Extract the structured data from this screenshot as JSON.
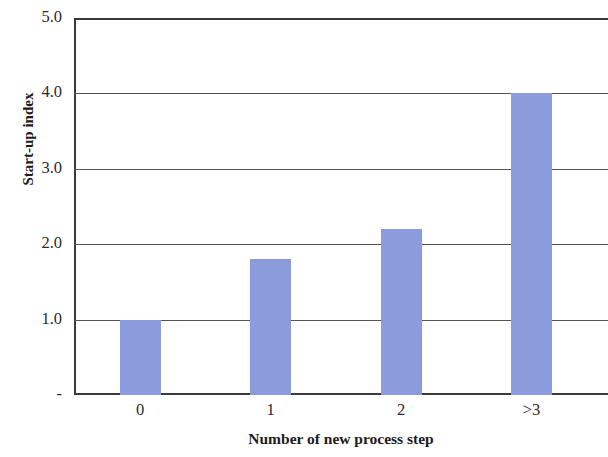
{
  "chart_data": {
    "type": "bar",
    "title": "",
    "categories": [
      "0",
      "1",
      "2",
      ">3"
    ],
    "values": [
      1.0,
      1.8,
      2.2,
      4.0
    ],
    "series": [
      {
        "name": "Start-up index",
        "values": [
          1.0,
          1.8,
          2.2,
          4.0
        ]
      }
    ],
    "xlabel": "Number of new process step",
    "ylabel": "Start-up index",
    "ylim": [
      0,
      5
    ],
    "yticks": [
      0,
      1,
      2,
      3,
      4,
      5
    ],
    "ytick_labels": [
      "-",
      "1.0",
      "2.0",
      "3.0",
      "4.0",
      "5.0"
    ],
    "xtick_labels": [
      "0",
      "1",
      "2",
      ">3"
    ],
    "grid": "horizontal",
    "legend": "none",
    "bar_color": "#8b9bdb",
    "axis_color": "#3a3a3a",
    "gridline_color": "#555555",
    "background_color": "#ffffff"
  },
  "axes": {
    "y_title": "Start-up index",
    "x_title": "Number of new process step"
  }
}
